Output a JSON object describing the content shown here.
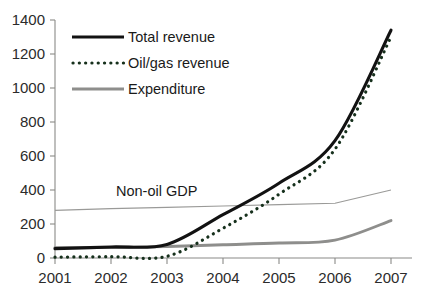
{
  "chart_data": {
    "type": "line",
    "title": "",
    "xlabel": "",
    "ylabel": "",
    "x": [
      2001,
      2002,
      2003,
      2004,
      2005,
      2006,
      2007
    ],
    "categories": [
      "2001",
      "2002",
      "2003",
      "2004",
      "2005",
      "2006",
      "2007"
    ],
    "xlim": [
      2001,
      2007
    ],
    "ylim": [
      0,
      1400
    ],
    "y_ticks": [
      0,
      200,
      400,
      600,
      800,
      1000,
      1200,
      1400
    ],
    "y_tick_labels": [
      "0",
      "200",
      "400",
      "600",
      "800",
      "1000",
      "1200",
      "1400"
    ],
    "grid": false,
    "legend_position": "top-left-inside",
    "series": [
      {
        "name": "Total revenue",
        "style": "solid",
        "color": "#121212",
        "values": [
          55,
          65,
          80,
          255,
          440,
          690,
          1340
        ]
      },
      {
        "name": "Oil/gas revenue",
        "style": "dotted",
        "color": "#16301c",
        "values": [
          5,
          8,
          10,
          175,
          375,
          640,
          1300
        ]
      },
      {
        "name": "Expenditure",
        "style": "solid",
        "color": "#8e8e8c",
        "values": [
          60,
          62,
          68,
          78,
          88,
          105,
          220
        ]
      },
      {
        "name": "Non-oil GDP",
        "style": "thin-solid",
        "color": "#9a9a98",
        "in_legend": false,
        "values": [
          280,
          290,
          298,
          306,
          314,
          322,
          400
        ]
      }
    ],
    "annotations": [
      {
        "text": "Non-oil GDP",
        "x": 2002.1,
        "y": 400
      }
    ]
  },
  "legend": {
    "items": [
      {
        "label": "Total revenue",
        "swatch": "solid-black-line-swatch"
      },
      {
        "label": "Oil/gas revenue",
        "swatch": "dotted-green-line-swatch"
      },
      {
        "label": "Expenditure",
        "swatch": "solid-gray-line-swatch"
      }
    ]
  },
  "axes": {
    "y_tick_labels": [
      "1400",
      "1200",
      "1000",
      "800",
      "600",
      "400",
      "200",
      "0"
    ],
    "x_tick_labels": [
      "2001",
      "2002",
      "2003",
      "2004",
      "2005",
      "2006",
      "2007"
    ]
  },
  "colors": {
    "total_revenue": "#121212",
    "oil_gas_revenue": "#16301c",
    "expenditure": "#8e8e8c",
    "non_oil_gdp": "#9a9a98",
    "axis": "#8a8a88",
    "background": "#ffffff"
  }
}
